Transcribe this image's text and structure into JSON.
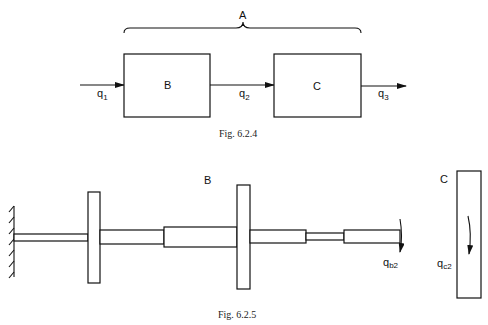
{
  "figure_1": {
    "caption": "Fig. 6.2.4",
    "brace_label": "A",
    "blocks": [
      {
        "label": "B"
      },
      {
        "label": "C"
      }
    ],
    "signals": [
      {
        "symbol": "q",
        "sub": "1"
      },
      {
        "symbol": "q",
        "sub": "2"
      },
      {
        "symbol": "q",
        "sub": "3"
      }
    ]
  },
  "figure_2": {
    "caption": "Fig. 6.2.5",
    "subsystem_b_label": "B",
    "subsystem_c_label": "C",
    "coordinate_b": {
      "symbol": "q",
      "sub": "b2"
    },
    "coordinate_c": {
      "symbol": "q",
      "sub": "c2"
    }
  }
}
